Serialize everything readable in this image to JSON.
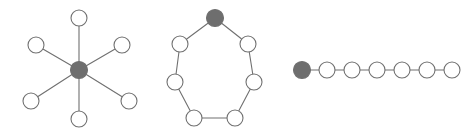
{
  "figure": {
    "title": "",
    "background_color": "#ffffff",
    "node_stroke_color": "#707070",
    "edge_color": "#707070",
    "node_fill_plain": "#ffffff",
    "node_fill_root": "#6e6e6e",
    "node_radius": 8,
    "root_node_radius": 8.5,
    "edge_width": 1.1,
    "width": 463,
    "height": 137
  },
  "graphs": [
    {
      "name": "star-graph",
      "label": "star-graph",
      "topology": "star",
      "node_count": 7,
      "edge_count": 6,
      "nodes": [
        {
          "id": "s0",
          "role": "root",
          "x": 79,
          "y": 70
        },
        {
          "id": "s1",
          "role": "leaf",
          "x": 79,
          "y": 18
        },
        {
          "id": "s2",
          "role": "leaf",
          "x": 122,
          "y": 45
        },
        {
          "id": "s3",
          "role": "leaf",
          "x": 129,
          "y": 101
        },
        {
          "id": "s4",
          "role": "leaf",
          "x": 79,
          "y": 119
        },
        {
          "id": "s5",
          "role": "leaf",
          "x": 31,
          "y": 101
        },
        {
          "id": "s6",
          "role": "leaf",
          "x": 36,
          "y": 45
        }
      ],
      "edges": [
        {
          "from": "s0",
          "to": "s1"
        },
        {
          "from": "s0",
          "to": "s2"
        },
        {
          "from": "s0",
          "to": "s3"
        },
        {
          "from": "s0",
          "to": "s4"
        },
        {
          "from": "s0",
          "to": "s5"
        },
        {
          "from": "s0",
          "to": "s6"
        }
      ]
    },
    {
      "name": "cycle-graph",
      "label": "cycle-graph",
      "topology": "cycle",
      "node_count": 8,
      "edge_count": 8,
      "nodes": [
        {
          "id": "c0",
          "role": "root",
          "x": 215,
          "y": 18
        },
        {
          "id": "c1",
          "role": "ring",
          "x": 248,
          "y": 44
        },
        {
          "id": "c2",
          "role": "ring",
          "x": 254,
          "y": 82
        },
        {
          "id": "c3",
          "role": "ring",
          "x": 235,
          "y": 118
        },
        {
          "id": "c4",
          "role": "ring",
          "x": 194,
          "y": 118
        },
        {
          "id": "c5",
          "role": "ring",
          "x": 175,
          "y": 82
        },
        {
          "id": "c6",
          "role": "ring",
          "x": 180,
          "y": 44
        }
      ],
      "edges": [
        {
          "from": "c0",
          "to": "c1"
        },
        {
          "from": "c1",
          "to": "c2"
        },
        {
          "from": "c2",
          "to": "c3"
        },
        {
          "from": "c3",
          "to": "c4"
        },
        {
          "from": "c4",
          "to": "c5"
        },
        {
          "from": "c5",
          "to": "c6"
        },
        {
          "from": "c6",
          "to": "c0"
        }
      ]
    },
    {
      "name": "path-graph",
      "label": "path-graph",
      "topology": "path",
      "node_count": 7,
      "edge_count": 6,
      "nodes": [
        {
          "id": "p0",
          "role": "root",
          "x": 302,
          "y": 70
        },
        {
          "id": "p1",
          "role": "link",
          "x": 327,
          "y": 70
        },
        {
          "id": "p2",
          "role": "link",
          "x": 352,
          "y": 70
        },
        {
          "id": "p3",
          "role": "link",
          "x": 377,
          "y": 70
        },
        {
          "id": "p4",
          "role": "link",
          "x": 402,
          "y": 70
        },
        {
          "id": "p5",
          "role": "link",
          "x": 427,
          "y": 70
        },
        {
          "id": "p6",
          "role": "link",
          "x": 452,
          "y": 70
        }
      ],
      "edges": [
        {
          "from": "p0",
          "to": "p1"
        },
        {
          "from": "p1",
          "to": "p2"
        },
        {
          "from": "p2",
          "to": "p3"
        },
        {
          "from": "p3",
          "to": "p4"
        },
        {
          "from": "p4",
          "to": "p5"
        },
        {
          "from": "p5",
          "to": "p6"
        }
      ]
    }
  ]
}
